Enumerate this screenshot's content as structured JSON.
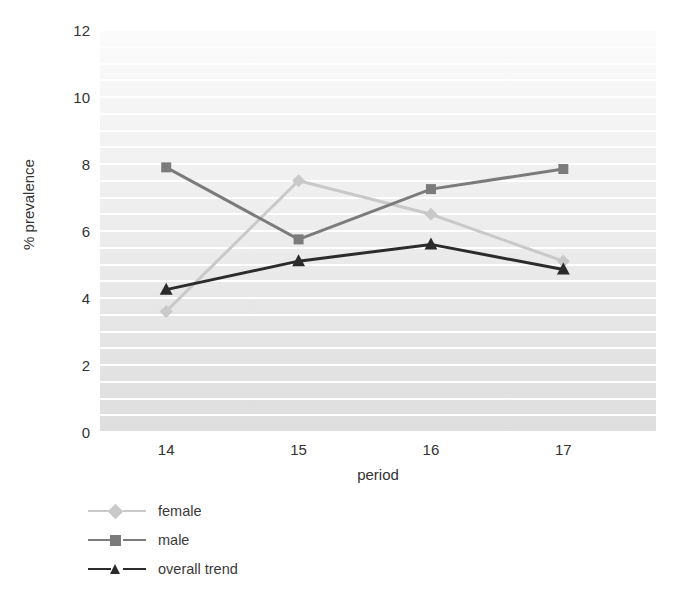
{
  "chart_data": {
    "type": "line",
    "title": "",
    "xlabel": "period",
    "ylabel": "% prevalence",
    "categories": [
      "14",
      "15",
      "16",
      "17"
    ],
    "x": [
      14,
      15,
      16,
      17
    ],
    "xlim": [
      13.5,
      17.7
    ],
    "ylim": [
      0,
      12
    ],
    "yticks": [
      0,
      2,
      4,
      6,
      8,
      10,
      12
    ],
    "ytick_labels": [
      "0",
      "2",
      "4",
      "6",
      "8",
      "10",
      "12"
    ],
    "xtick_labels": [
      "14",
      "15",
      "16",
      "17"
    ],
    "grid": true,
    "grid_minor_step": 0.5,
    "grid_color": "#ffffff",
    "plot_background": "#ededed",
    "legend_position": "below-left",
    "series": [
      {
        "name": "female",
        "values": [
          3.6,
          7.5,
          6.5,
          5.1
        ],
        "color": "#c9c9c9",
        "marker": "diamond"
      },
      {
        "name": "male",
        "values": [
          7.9,
          5.75,
          7.25,
          7.85
        ],
        "color": "#7b7b7b",
        "marker": "square"
      },
      {
        "name": "overall trend",
        "values": [
          4.25,
          5.1,
          5.6,
          4.85
        ],
        "color": "#2b2b2b",
        "marker": "triangle"
      }
    ]
  },
  "axes": {
    "ylabel": "% prevalence",
    "xlabel": "period",
    "ytick_0": "0",
    "ytick_1": "2",
    "ytick_2": "4",
    "ytick_3": "6",
    "ytick_4": "8",
    "ytick_5": "10",
    "ytick_6": "12",
    "xtick_0": "14",
    "xtick_1": "15",
    "xtick_2": "16",
    "xtick_3": "17"
  },
  "legend": {
    "items": [
      {
        "label": "female"
      },
      {
        "label": "male"
      },
      {
        "label": "overall trend"
      }
    ]
  }
}
